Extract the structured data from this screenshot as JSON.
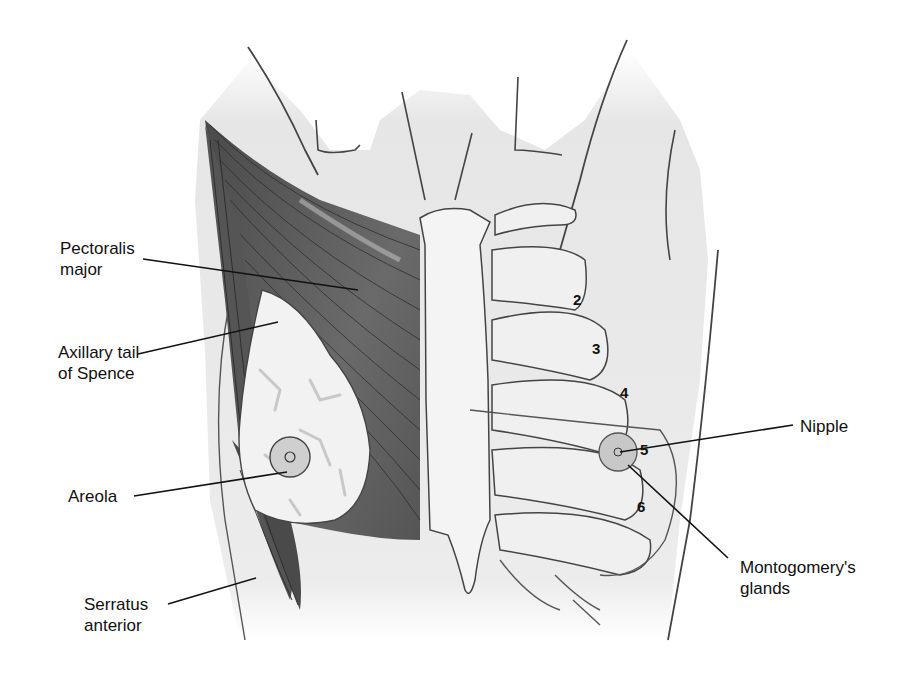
{
  "figure": {
    "type": "anatomical-illustration",
    "colors": {
      "background": "#ffffff",
      "skin": "#e9e9e9",
      "muscle": "#5e5e5e",
      "muscle_light": "#8a8a8a",
      "gland": "#f2f2f2",
      "bone": "#f0f0f0",
      "outline": "#3a3a3a",
      "leader_line": "#111111"
    },
    "labels_left": [
      {
        "id": "pectoralis-major",
        "lines": [
          "Pectoralis",
          "major"
        ]
      },
      {
        "id": "axillary-tail",
        "lines": [
          "Axillary tail",
          "of Spence"
        ]
      },
      {
        "id": "areola",
        "lines": [
          "Areola"
        ]
      },
      {
        "id": "serratus-anterior",
        "lines": [
          "Serratus",
          "anterior"
        ]
      }
    ],
    "labels_right": [
      {
        "id": "nipple",
        "lines": [
          "Nipple"
        ]
      },
      {
        "id": "montgomerys-glands",
        "lines": [
          "Montogomery's",
          "glands"
        ]
      }
    ],
    "rib_numbers": [
      "2",
      "3",
      "4",
      "5",
      "6"
    ]
  }
}
